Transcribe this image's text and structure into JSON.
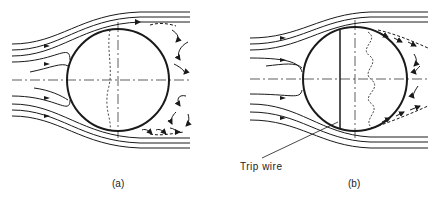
{
  "figure": {
    "panel_a": {
      "caption": "(a)"
    },
    "panel_b": {
      "caption": "(b)",
      "annotation": "Trip wire"
    }
  },
  "colors": {
    "ink": "#1a1a1a",
    "background": "#ffffff"
  }
}
